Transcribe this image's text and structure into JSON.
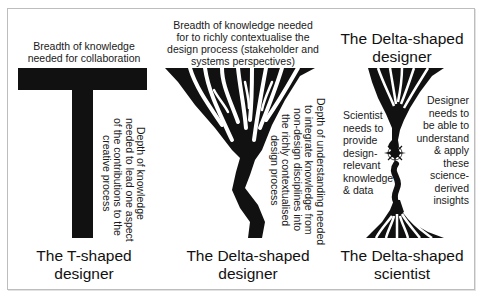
{
  "figure": {
    "panels": [
      {
        "id": "t-shaped-designer",
        "top_label_lines": [
          "Breadth of knowledge",
          "needed for collaboration"
        ],
        "side_label_lines": [
          "Depth of knowledge",
          "needed to lead one aspect",
          "of the contributions to the",
          "creative process"
        ],
        "title_lines": [
          "The T-shaped",
          "designer"
        ]
      },
      {
        "id": "delta-shaped-designer",
        "top_label_lines": [
          "Breadth of knowledge needed",
          "for to richly contextualise the",
          "design process (stakeholder and",
          "systems perspectives)"
        ],
        "side_label_lines": [
          "Depth of understanding needed",
          "to integrate knowledge from",
          "non-design disciplines into",
          "the richly contextualised",
          "design process"
        ],
        "title_lines": [
          "The Delta-shaped",
          "designer"
        ]
      },
      {
        "id": "delta-shaped-scientist",
        "top_title_lines": [
          "The Delta-shaped",
          "designer"
        ],
        "left_label_lines": [
          "Scientist",
          "needs to",
          "provide",
          "design-",
          "relevant",
          "knowledge",
          "& data"
        ],
        "right_label_lines": [
          "Designer",
          "needs to",
          "be able to",
          "understand",
          "& apply",
          "these",
          "science-",
          "derived",
          "insights"
        ],
        "title_lines": [
          "The Delta-shaped",
          "scientist"
        ],
        "center_icon": "compass-rose-icon"
      }
    ],
    "colors": {
      "shape": "#111111",
      "frame": "#bdbdbd",
      "text": "#1a1a1a"
    }
  }
}
